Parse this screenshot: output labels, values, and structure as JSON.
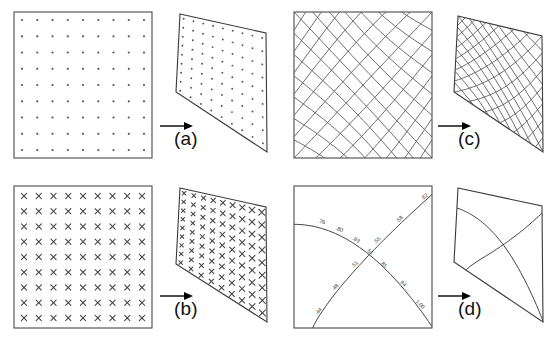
{
  "figure": {
    "panels": [
      {
        "id": "a",
        "caption": "(a)",
        "source_kind": "dot-grid-square",
        "target_kind": "dot-grid-quadrilateral",
        "grid_rows": 9,
        "grid_cols": 9,
        "arrow": "right-arrow"
      },
      {
        "id": "b",
        "caption": "(b)",
        "source_kind": "cross-grid-square",
        "target_kind": "cross-grid-quadrilateral",
        "grid_rows": 9,
        "grid_cols": 9,
        "arrow": "right-arrow"
      },
      {
        "id": "c",
        "caption": "(c)",
        "source_kind": "curvilinear-mesh-square",
        "target_kind": "curvilinear-mesh-quadrilateral",
        "mesh_lines_per_family": 13,
        "arrow": "right-arrow"
      },
      {
        "id": "d",
        "caption": "(d)",
        "source_kind": "two-labelled-curves-square",
        "target_kind": "two-curves-quadrilateral",
        "arrow": "right-arrow"
      }
    ]
  },
  "chart_data": {
    "type": "diagram",
    "panel_labels": [
      "(a)",
      "(b)",
      "(c)",
      "(d)"
    ],
    "curve_labels_panel_d": {
      "descending_curve": [
        ".76",
        ".80",
        ".83",
        ".51",
        ".85",
        ".94",
        "1.00"
      ],
      "ascending_curve": [
        ".44",
        ".48",
        ".51",
        ".55",
        ".58",
        ".62"
      ],
      "all_values_in_reading_order": [
        ".76",
        ".80",
        ".83",
        ".55",
        ".58",
        ".62",
        ".51",
        ".85",
        ".48",
        ".94",
        ".44",
        "1.00"
      ]
    },
    "source_square": {
      "x0": 0,
      "y0": 0,
      "x1": 1,
      "y1": 1
    },
    "target_quadrilateral_normalized": {
      "top_left": [
        0.03,
        0.1
      ],
      "top_right": [
        1.0,
        0.24
      ],
      "bottom_right": [
        1.0,
        1.0
      ],
      "bottom_left": [
        0.0,
        0.57
      ]
    }
  }
}
